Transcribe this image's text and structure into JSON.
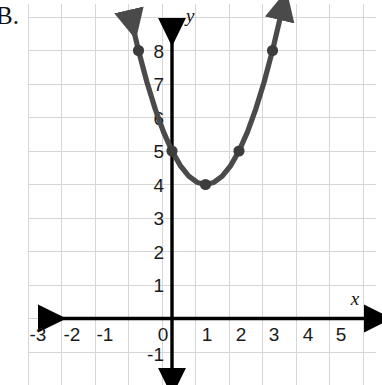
{
  "question": {
    "label": "B."
  },
  "chart_data": {
    "type": "line",
    "title": "",
    "xlabel": "x",
    "ylabel": "y",
    "xlim": [
      -3.7,
      5.8
    ],
    "ylim": [
      -1.6,
      8.9
    ],
    "grid": true,
    "legend": null,
    "equation": "y = (x - 1)^2 + 4",
    "x_ticks": [
      "-3",
      "-2",
      "-1",
      "0",
      "1",
      "2",
      "3",
      "4",
      "5"
    ],
    "x_tick_values": [
      -3,
      -2,
      -1,
      0,
      1,
      2,
      3,
      4,
      5
    ],
    "y_ticks": [
      "-1",
      "1",
      "2",
      "3",
      "4",
      "5",
      "6",
      "7",
      "8"
    ],
    "y_tick_values": [
      -1,
      1,
      2,
      3,
      4,
      5,
      6,
      7,
      8
    ],
    "origin_label": "0",
    "series": [
      {
        "name": "parabola",
        "color": "#4a4a4a",
        "marked_points": [
          {
            "x": -1,
            "y": 8
          },
          {
            "x": 0,
            "y": 5
          },
          {
            "x": 1,
            "y": 4
          },
          {
            "x": 2,
            "y": 5
          },
          {
            "x": 3,
            "y": 8
          }
        ],
        "x": [
          -1.25,
          -1,
          -0.75,
          -0.5,
          -0.25,
          0,
          0.25,
          0.5,
          0.75,
          1,
          1.25,
          1.5,
          1.75,
          2,
          2.25,
          2.5,
          2.75,
          3,
          3.25
        ],
        "values": [
          9.0625,
          8,
          7.0625,
          6.25,
          5.5625,
          5,
          4.5625,
          4.25,
          4.0625,
          4,
          4.0625,
          4.25,
          4.5625,
          5,
          5.5625,
          6.25,
          7.0625,
          8,
          9.0625
        ],
        "arrow_start": true,
        "arrow_end": true
      }
    ],
    "axis_arrows": {
      "x_left": true,
      "x_right": true,
      "y_up": true,
      "y_down": true
    },
    "colors": {
      "grid": "#d4d4d4",
      "axis": "#000000",
      "curve": "#4a4a4a",
      "point": "#3c3c3c",
      "text": "#1a1a1a",
      "background": "#ffffff"
    }
  }
}
